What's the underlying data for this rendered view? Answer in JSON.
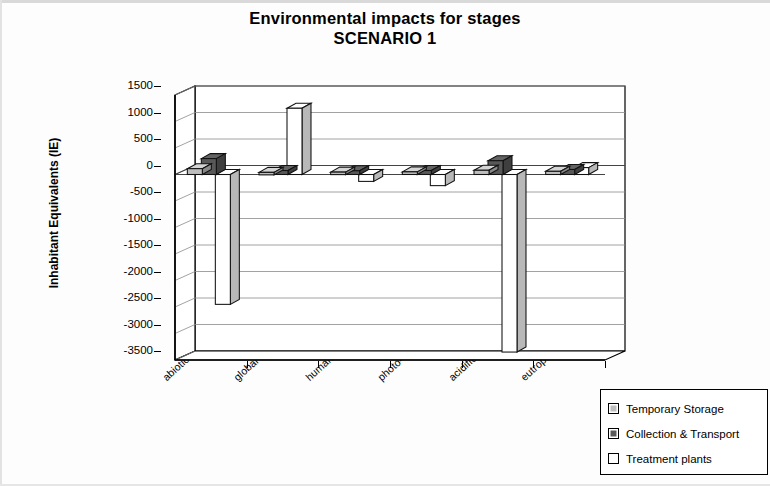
{
  "chart_data": {
    "type": "bar",
    "title": "Environmental impacts for stages",
    "subtitle": "SCENARIO 1",
    "xlabel": "",
    "ylabel": "Inhabitant Equivalents (IE)",
    "ylim": [
      -3500,
      1500
    ],
    "ytick_step": 500,
    "yticks": [
      "1500",
      "1000",
      "500",
      "0",
      "-500",
      "-1000",
      "-1500",
      "-2000",
      "-2500",
      "-3000",
      "-3500"
    ],
    "grid": true,
    "legend_position": "bottom-right",
    "style": "3d-clustered-column",
    "categories": [
      "abiotic depletion",
      "global warming",
      "human toxicity",
      "photo-oxidation",
      "acidification",
      "eutrophication"
    ],
    "series": [
      {
        "name": "Temporary Storage",
        "color": "#bdbdbd",
        "values": [
          110,
          40,
          45,
          50,
          80,
          60
        ]
      },
      {
        "name": "Collection & Transport",
        "color": "#585858",
        "values": [
          300,
          75,
          70,
          75,
          260,
          95
        ]
      },
      {
        "name": "Treatment plants",
        "color": "#ffffff",
        "values": [
          -2450,
          1250,
          -130,
          -210,
          -3350,
          130
        ]
      }
    ]
  },
  "legend": {
    "items": [
      {
        "label": "Temporary Storage",
        "color": "#bdbdbd"
      },
      {
        "label": "Collection & Transport",
        "color": "#585858"
      },
      {
        "label": "Treatment plants",
        "color": "#ffffff"
      }
    ]
  },
  "colors": {
    "temporary_storage": "#bdbdbd",
    "collection_transport": "#585858",
    "treatment_plants": "#ffffff",
    "axis": "#000000",
    "gridline": "#8a8a8a",
    "page_background": "#fdfdfd"
  }
}
